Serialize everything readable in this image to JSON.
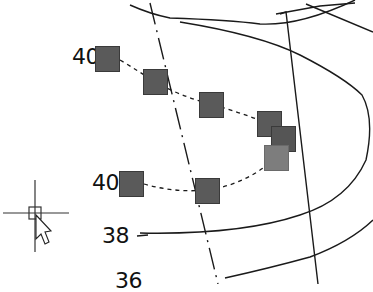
{
  "view": {
    "type": "cad-drawing-canvas",
    "background": "#ffffff"
  },
  "contour_labels": [
    {
      "id": "label-40-top",
      "text": "40",
      "x": 72,
      "y": 46
    },
    {
      "id": "label-40-bottom",
      "text": "40",
      "x": 92,
      "y": 172
    },
    {
      "id": "label-38",
      "text": "38",
      "x": 102,
      "y": 225
    },
    {
      "id": "label-36",
      "text": "36",
      "x": 115,
      "y": 270
    }
  ],
  "markers": [
    {
      "id": "marker-1",
      "x": 95,
      "y": 46,
      "color": "#5a5a5a"
    },
    {
      "id": "marker-2",
      "x": 143,
      "y": 69,
      "color": "#5a5a5a"
    },
    {
      "id": "marker-3",
      "x": 199,
      "y": 92,
      "color": "#5a5a5a"
    },
    {
      "id": "marker-4",
      "x": 257,
      "y": 111,
      "color": "#5a5a5a"
    },
    {
      "id": "marker-5",
      "x": 271,
      "y": 126,
      "color": "#555555"
    },
    {
      "id": "marker-6",
      "x": 264,
      "y": 145,
      "color": "#7d7d7d"
    },
    {
      "id": "marker-7",
      "x": 119,
      "y": 171,
      "color": "#5a5a5a"
    },
    {
      "id": "marker-8",
      "x": 195,
      "y": 178,
      "color": "#5a5a5a"
    }
  ],
  "cursor": {
    "type": "crosshair-with-pickbox-and-arrow",
    "x": 35,
    "y": 213
  },
  "colors": {
    "line": "#1a1a1a",
    "marker_fill": "#5a5a5a",
    "marker_highlight": "#7d7d7d",
    "text": "#111111"
  }
}
